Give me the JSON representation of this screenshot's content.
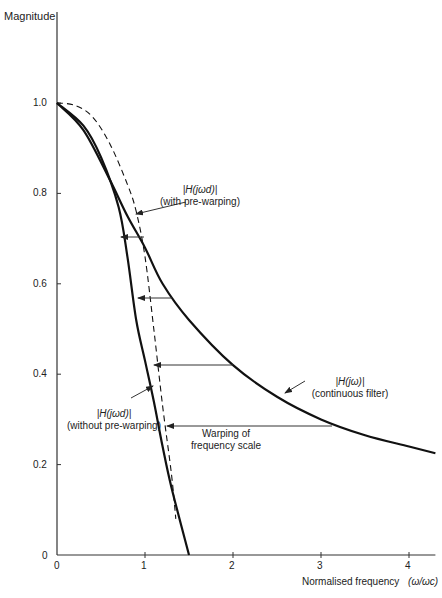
{
  "chart_data": {
    "type": "line",
    "title": "",
    "xlabel": "Normalised frequency  (ω/ωc)",
    "ylabel": "Magnitude",
    "xlim": [
      0,
      4.3
    ],
    "ylim": [
      0,
      1.0
    ],
    "x_ticks": [
      "0",
      "1",
      "2",
      "3",
      "4"
    ],
    "y_ticks": [
      "0",
      "0.2",
      "0.4",
      "0.6",
      "0.8",
      "1.0"
    ],
    "grid": false,
    "series": [
      {
        "name": "|H(jω)| (continuous filter)",
        "style": "solid",
        "x": [
          0,
          0.3,
          0.6,
          0.8,
          1.0,
          1.2,
          1.5,
          2.0,
          2.5,
          3.0,
          3.5,
          4.0,
          4.3
        ],
        "values": [
          1.0,
          0.94,
          0.83,
          0.75,
          0.68,
          0.6,
          0.52,
          0.42,
          0.35,
          0.3,
          0.265,
          0.24,
          0.225
        ]
      },
      {
        "name": "|H(jωd)| (without pre-warping)",
        "style": "solid",
        "x": [
          0,
          0.3,
          0.5,
          0.7,
          0.8,
          0.9,
          1.0,
          1.1,
          1.2,
          1.3,
          1.5
        ],
        "values": [
          1.0,
          0.95,
          0.88,
          0.77,
          0.66,
          0.52,
          0.43,
          0.34,
          0.24,
          0.15,
          0.0
        ]
      },
      {
        "name": "|H(jωd)| (with pre-warping)",
        "style": "dashed",
        "x": [
          0,
          0.2,
          0.4,
          0.6,
          0.8,
          0.9,
          1.0,
          1.1,
          1.2,
          1.3,
          1.35
        ],
        "values": [
          1.0,
          0.995,
          0.97,
          0.91,
          0.82,
          0.76,
          0.66,
          0.5,
          0.33,
          0.18,
          0.08
        ]
      }
    ],
    "annotations": [
      {
        "text": "Warping of frequency scale",
        "arrows_y": [
          0.62,
          0.55,
          0.42,
          0.29
        ]
      }
    ]
  },
  "labels": {
    "ylabel": "Magnitude",
    "xlabel": "Normalised frequency",
    "xlabel_unit": "(ω/ωc)",
    "with_pre_1": "|H(jωd)|",
    "with_pre_2": "(with pre-warping)",
    "without_pre_1": "|H(jωd)|",
    "without_pre_2": "(without pre-warping)",
    "cont_1": "|H(jω)|",
    "cont_2": "(continuous filter)",
    "warp_1": "Warping of",
    "warp_2": "frequency scale",
    "xt": [
      "0",
      "1",
      "2",
      "3",
      "4"
    ],
    "yt": [
      "0",
      "0.2",
      "0.4",
      "0.6",
      "0.8",
      "1.0"
    ]
  }
}
